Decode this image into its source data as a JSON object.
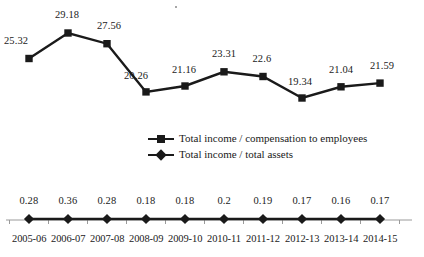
{
  "chart_data": {
    "type": "line",
    "title": "",
    "subtitle": "",
    "xlabel": "",
    "ylabel": "",
    "grid": false,
    "legend_position": "center",
    "categories": [
      "2005-06",
      "2006-07",
      "2007-08",
      "2008-09",
      "2009-10",
      "2010-11",
      "2011-12",
      "2012-13",
      "2013-14",
      "2014-15"
    ],
    "series": [
      {
        "name": "Total income / compensation to employees",
        "marker": "square",
        "values": [
          25.32,
          29.18,
          27.56,
          20.26,
          21.16,
          23.31,
          22.6,
          19.34,
          21.04,
          21.59
        ],
        "labels": [
          "25.32",
          "29.18",
          "27.56",
          "20.26",
          "21.16",
          "23.31",
          "22.6",
          "19.34",
          "21.04",
          "21.59"
        ],
        "ylim": [
          17.5,
          30.5
        ],
        "color": "#1a1a1a"
      },
      {
        "name": "Total income / total assets",
        "marker": "diamond",
        "values": [
          0.28,
          0.36,
          0.28,
          0.18,
          0.18,
          0.2,
          0.19,
          0.17,
          0.16,
          0.17
        ],
        "labels": [
          "0.28",
          "0.36",
          "0.28",
          "0.18",
          "0.18",
          "0.2",
          "0.19",
          "0.17",
          "0.16",
          "0.17"
        ],
        "ylim": [
          0,
          1
        ],
        "color": "#1a1a1a"
      }
    ],
    "axis_line_color": "#9a9a9a",
    "annotations": []
  },
  "legend": {
    "items": [
      {
        "label": "Total income / compensation to employees",
        "marker": "square"
      },
      {
        "label": "Total income / total assets",
        "marker": "diamond"
      }
    ]
  }
}
